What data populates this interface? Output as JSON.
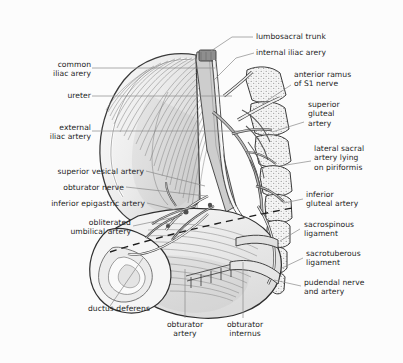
{
  "figure": {
    "background_color": "#fcfcfc",
    "ink_color": "#1d1d1d",
    "leader_color": "#8b8b8b",
    "muscle_fill": "#e9e9e9",
    "bone_fill": "#f4f4f4",
    "vessel_fill": "#bdbdbd",
    "style": "grayscale line-and-tone medical illustration"
  },
  "labels": {
    "common_iliac_artery": "common\niliac arery",
    "ureter": "ureter",
    "external_iliac_artery": "external\niliac artery",
    "superior_vesical_artery": "superior vesical artery",
    "obturator_nerve": "obturator nerve",
    "inferior_epigastric_artery": "inferior epigastric artery",
    "obliterated_umbilical_artery": "obliterated\numbilical artery",
    "ductus_deferens": "ductus deferens",
    "obturator_artery": "obturator\nartery",
    "obturator_internus": "obturator\ninternus",
    "lumbosacral_trunk": "lumbosacral trunk",
    "internal_iliac_artery": "internal iliac arery",
    "anterior_ramus_s1": "anterior ramus\nof S1 nerve",
    "superior_gluteal_artery": "superior\ngluteal\nartery",
    "lateral_sacral_artery": "lateral sacral\nartery lying\non piriformis",
    "inferior_gluteal_artery": "inferior\ngluteal artery",
    "sacrospinous_ligament": "sacrospinous\nligament",
    "sacrotuberous_ligament": "sacrotuberous\nligament",
    "pudendal_nerve_and_artery": "pudendal nerve\nand artery"
  },
  "structures": {
    "iliacus_muscle": "iliacus muscle fan",
    "psoas_major": "psoas major band",
    "sacrum_segments": "stippled sacral vertebral blocks",
    "coccyx": "coccyx tip",
    "obturator_internus_muscle": "obturator internus fascia",
    "dashed_pelvic_brim": "dashed reference line across pelvis"
  }
}
